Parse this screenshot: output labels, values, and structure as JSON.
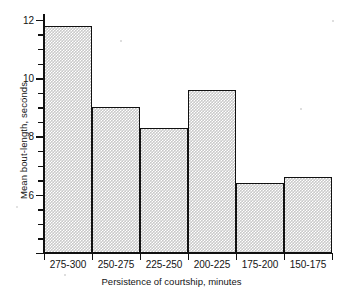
{
  "chart_data": {
    "type": "bar",
    "title": "",
    "xlabel": "Persistence of courtship, minutes",
    "ylabel": "Mean bout-length, seconds",
    "categories": [
      "275-300",
      "250-275",
      "225-250",
      "200-225",
      "175-200",
      "150-175"
    ],
    "values": [
      11.8,
      9.0,
      8.3,
      9.6,
      6.4,
      6.6
    ],
    "ylim": [
      4.0,
      12.2
    ],
    "ytick_labels": [
      "12",
      "10",
      "8",
      "6"
    ],
    "ytick_values": [
      12,
      10,
      8,
      6
    ],
    "yminor_values": [
      11.5,
      11,
      10.5,
      9.5,
      9,
      8.5,
      7.5,
      7,
      6.5,
      5.5,
      5,
      4.5
    ],
    "grid": false,
    "legend": null,
    "bar_fill": "#c9c9c9",
    "bar_edge": "#111111",
    "axis_color": "#101010",
    "background": "#ffffff"
  }
}
